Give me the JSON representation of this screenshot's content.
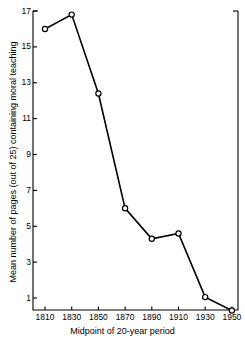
{
  "chart_data": {
    "type": "line",
    "title": "",
    "xlabel": "Midpoint of 20-year period",
    "ylabel": "Mean number of pages (out of 25) containing moral teaching",
    "x": [
      1810,
      1830,
      1850,
      1870,
      1890,
      1910,
      1930,
      1950
    ],
    "values": [
      16.0,
      16.8,
      12.4,
      6.0,
      4.3,
      4.6,
      1.05,
      0.3
    ],
    "xticklabels": [
      "1810",
      "1830",
      "1850",
      "1870",
      "1890",
      "1910",
      "1930",
      "1950"
    ],
    "yticks": [
      17,
      15,
      13,
      11,
      9,
      7,
      5,
      3,
      1
    ],
    "yticklabels": [
      "17",
      "15",
      "13",
      "11",
      "9",
      "7",
      "5",
      "3",
      "1"
    ],
    "xlim": [
      1800,
      1960
    ],
    "ylim": [
      0.18,
      17.0
    ],
    "grid": false,
    "legend": "none",
    "marker": "open-circle",
    "line_color": "#000000",
    "marker_fill": "#ffffff",
    "background": "#ffffff"
  }
}
